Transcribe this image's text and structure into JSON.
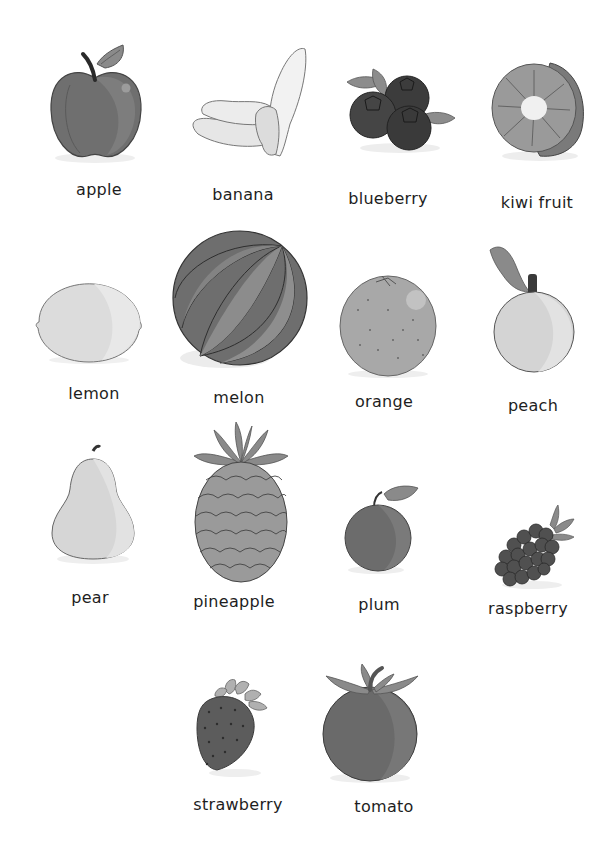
{
  "page": {
    "background": "#ffffff",
    "style": "grayscale"
  },
  "fruits": [
    {
      "label": "apple"
    },
    {
      "label": "banana"
    },
    {
      "label": "blueberry"
    },
    {
      "label": "kiwi fruit"
    },
    {
      "label": "lemon"
    },
    {
      "label": "melon"
    },
    {
      "label": "orange"
    },
    {
      "label": "peach"
    },
    {
      "label": "pear"
    },
    {
      "label": "pineapple"
    },
    {
      "label": "plum"
    },
    {
      "label": "raspberry"
    },
    {
      "label": "strawberry"
    },
    {
      "label": "tomato"
    }
  ]
}
